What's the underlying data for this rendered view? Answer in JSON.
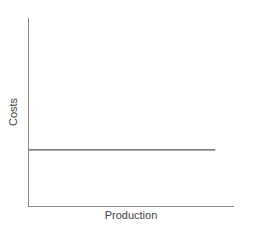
{
  "chart_data": {
    "type": "line",
    "title": "",
    "xlabel": "Production",
    "ylabel": "Costs",
    "x": [
      0,
      1
    ],
    "series": [
      {
        "name": "Fixed costs",
        "values": [
          0.3,
          0.3
        ]
      }
    ],
    "xlim": [
      0,
      1.1
    ],
    "ylim": [
      0,
      1
    ],
    "grid": false,
    "legend": "none",
    "ticks": "none",
    "colors": {
      "axis": "#888888",
      "line": "#555555",
      "text": "#444444"
    }
  }
}
